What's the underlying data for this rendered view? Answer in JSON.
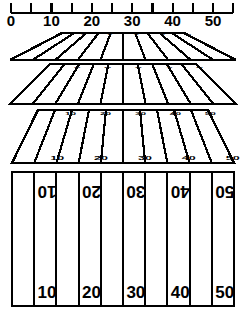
{
  "figure": {
    "ink_color": "#000000",
    "paper_color": "#ffffff"
  },
  "ruler": {
    "name": "measurement-scale",
    "tick_count": 12,
    "tick_spacing_px": 20.2,
    "origin_x_px": 11,
    "baseline_y_px": 13,
    "major_labels": [
      "0",
      "10",
      "20",
      "30",
      "40",
      "50"
    ],
    "major_label_values": [
      0,
      10,
      20,
      30,
      40,
      50
    ],
    "label_xs": [
      11,
      51.4,
      91.8,
      132.2,
      172.6,
      213
    ],
    "label_y_px": 26,
    "label_font_px": 15
  },
  "fields": [
    {
      "id": "field-1",
      "name": "field-perspective-flattest",
      "description": "extreme foreshortening, near edge-on view",
      "top_y": 33,
      "bottom_y": 60,
      "top_left_x": 62,
      "top_right_x": 184,
      "bottom_left_x": 10,
      "bottom_right_x": 236,
      "yard_numbers": [
        "10",
        "20",
        "30",
        "40",
        "50"
      ],
      "number_font_px": 4,
      "number_squash": 0.18,
      "line_count": 11
    },
    {
      "id": "field-2",
      "name": "field-perspective-low",
      "description": "strong foreshortening",
      "top_y": 64,
      "bottom_y": 104,
      "top_left_x": 50,
      "top_right_x": 196,
      "bottom_left_x": 10,
      "bottom_right_x": 236,
      "yard_numbers": [
        "10",
        "20",
        "30",
        "40",
        "50"
      ],
      "number_font_px": 6,
      "number_squash": 0.3,
      "line_count": 11
    },
    {
      "id": "field-3",
      "name": "field-perspective-medium",
      "description": "moderate foreshortening",
      "top_y": 110,
      "bottom_y": 163,
      "top_left_x": 38,
      "top_right_x": 208,
      "bottom_left_x": 12,
      "bottom_right_x": 234,
      "yard_numbers": [
        "10",
        "20",
        "30",
        "40",
        "50"
      ],
      "number_font_px": 10,
      "number_squash": 0.42,
      "line_count": 11
    },
    {
      "id": "field-4",
      "name": "field-plan-view",
      "description": "overhead plan view, no foreshortening",
      "top_y": 172,
      "bottom_y": 306,
      "left_x": 12,
      "right_x": 234,
      "yard_numbers_top": [
        "10",
        "20",
        "30",
        "40",
        "50"
      ],
      "yard_numbers_bottom": [
        "10",
        "20",
        "30",
        "40",
        "50"
      ],
      "top_numbers_rotated_deg": 180,
      "number_font_px": 17,
      "line_count": 11
    }
  ]
}
